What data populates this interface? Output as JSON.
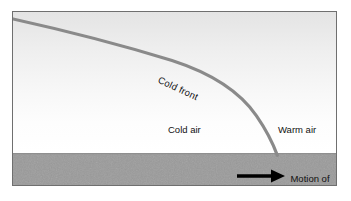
{
  "figure": {
    "type": "meteorology-cross-section"
  },
  "labels": {
    "cold_front": "Cold front",
    "cold_air": "Cold air",
    "warm_air": "Warm air",
    "motion_of_front_line1": "Motion of",
    "motion_of_front_line2": "front",
    "motion_of_front": "Motion of front"
  },
  "colors": {
    "front_line": "#8a8a8a",
    "ground": "#9b9b9b",
    "sky_top": "#e4e4e4",
    "sky_bottom": "#ffffff",
    "frame_border": "#6f6f6f",
    "arrow": "#000000",
    "text": "#111111"
  },
  "geometry": {
    "frame": {
      "x": 12,
      "y": 11,
      "width": 325,
      "height": 175
    },
    "ground_top_y": 152,
    "front_line_start": {
      "x": 13,
      "y": 19
    },
    "front_line_ground_contact": {
      "x": 278,
      "y": 155
    },
    "front_line_width": 3.2,
    "arrow_start_x": 236,
    "arrow_end_x": 280,
    "arrow_y": 173,
    "cold_front_label_rotation_deg": 25
  }
}
